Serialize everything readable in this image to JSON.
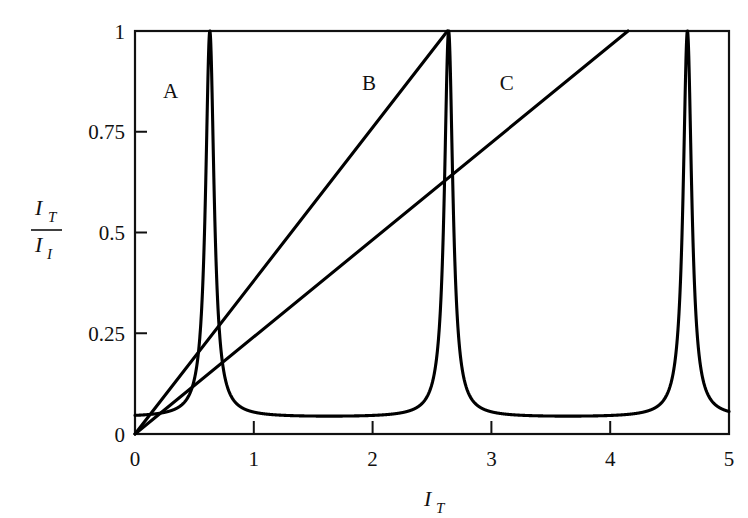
{
  "figure": {
    "background_color": "#ffffff",
    "ink_color": "#000000"
  },
  "chart_data": {
    "type": "line",
    "title": "",
    "subtitle": "",
    "xlabel": "I_T",
    "xlabel_main": "I",
    "xlabel_sub": "T",
    "ylabel": "I_T / I_I",
    "ylabel_numerator_main": "I",
    "ylabel_numerator_sub": "T",
    "ylabel_denominator_main": "I",
    "ylabel_denominator_sub": "I",
    "xlim": [
      0,
      5
    ],
    "ylim": [
      0,
      1
    ],
    "xticks": [
      0,
      1,
      2,
      3,
      4,
      5
    ],
    "xticklabels": [
      "0",
      "1",
      "2",
      "3",
      "4",
      "5"
    ],
    "yticks": [
      0,
      0.25,
      0.5,
      0.75,
      1
    ],
    "yticklabels": [
      "0",
      "0.25",
      "0.5",
      "0.75",
      "1"
    ],
    "grid": false,
    "legend_position": "inline-annotations",
    "annotations": [
      {
        "label": "A",
        "x": 0.3,
        "y": 0.85
      },
      {
        "label": "B",
        "x": 1.97,
        "y": 0.87
      },
      {
        "label": "C",
        "x": 3.13,
        "y": 0.87
      }
    ],
    "series": [
      {
        "name": "A",
        "kind": "airy-transmission-peaks",
        "description": "Fabry-Perot Airy function: sharp transmission resonances",
        "peak_positions": [
          0.63,
          2.63,
          4.65
        ],
        "peak_value": 1.0,
        "baseline_min": 0.04,
        "period": 2.01,
        "finesse_coefficient": 220,
        "endpoint_right": {
          "x": 5.0,
          "y": 0.15
        },
        "origin": {
          "x": 0.0,
          "y": 0.0
        }
      },
      {
        "name": "B",
        "kind": "straight-line",
        "description": "Straight line from origin reaching unity at the second resonance",
        "points": [
          [
            0.0,
            0.0
          ],
          [
            2.63,
            1.0
          ]
        ],
        "slope": 0.3802
      },
      {
        "name": "C",
        "kind": "straight-line",
        "description": "Shallower straight line from origin reaching unity near x = 4.15",
        "points": [
          [
            0.0,
            0.0
          ],
          [
            4.15,
            1.0
          ]
        ],
        "slope": 0.241
      }
    ]
  }
}
